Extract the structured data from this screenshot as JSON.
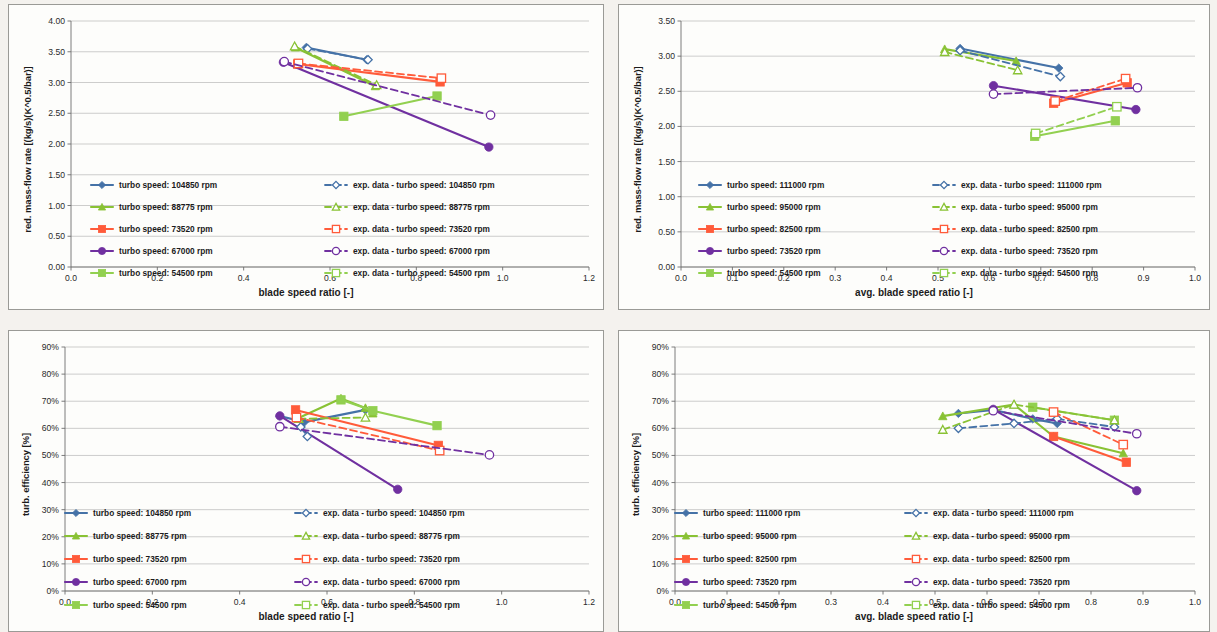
{
  "page": {
    "background": "#f4f2ee",
    "panel_background": "#fdfdfb",
    "panel_border": "#9a9a96"
  },
  "colors": {
    "blue": "#4572a7",
    "green": "#89c234",
    "orange": "#ff5b3a",
    "purple": "#7030a0",
    "lightgreen": "#92d050",
    "grid": "#b8b8b8",
    "axis": "#6d6d6d",
    "text": "#1b1b1b"
  },
  "charts": [
    {
      "id": "top-left",
      "name": "red-mass-flow-vs-blade-speed-ratio",
      "chart_data": {
        "type": "line",
        "title": "",
        "xlabel": "blade speed ratio [-]",
        "ylabel": "red. mass-flow rate [(kg/s)(K^0.5/bar)]",
        "xlim": [
          0.0,
          1.2
        ],
        "ylim": [
          0.0,
          4.0
        ],
        "xticks": [
          "0.0",
          "0.2",
          "0.4",
          "0.6",
          "0.8",
          "1.0",
          "1.2"
        ],
        "yticks": [
          "0.00",
          "0.50",
          "1.00",
          "1.50",
          "2.00",
          "2.50",
          "3.00",
          "3.50",
          "4.00"
        ],
        "grid": true,
        "legend_position": "inside-lower-center",
        "series": [
          {
            "name": "turbo speed: 104850 rpm",
            "color": "#4572a7",
            "style": "solid",
            "marker": "diamond",
            "filled": true,
            "x": [
              0.545,
              0.685
            ],
            "y": [
              3.57,
              3.37
            ]
          },
          {
            "name": "turbo speed: 88775 rpm",
            "color": "#89c234",
            "style": "solid",
            "marker": "triangle",
            "filled": true,
            "x": [
              0.52,
              0.705
            ],
            "y": [
              3.57,
              2.94
            ]
          },
          {
            "name": "turbo speed: 73520 rpm",
            "color": "#ff5b3a",
            "style": "solid",
            "marker": "square",
            "filled": true,
            "x": [
              0.525,
              0.855
            ],
            "y": [
              3.3,
              3.01
            ]
          },
          {
            "name": "turbo speed: 67000 rpm",
            "color": "#7030a0",
            "style": "solid",
            "marker": "circle",
            "filled": true,
            "x": [
              0.492,
              0.968
            ],
            "y": [
              3.33,
              1.95
            ]
          },
          {
            "name": "turbo speed: 54500 rpm",
            "color": "#92d050",
            "style": "solid",
            "marker": "square",
            "filled": true,
            "x": [
              0.632,
              0.848
            ],
            "y": [
              2.45,
              2.78
            ]
          },
          {
            "name": "exp. data - turbo speed: 104850 rpm",
            "color": "#4572a7",
            "style": "dashed",
            "marker": "diamond",
            "filled": false,
            "x": [
              0.548,
              0.688
            ],
            "y": [
              3.55,
              3.37
            ]
          },
          {
            "name": "exp. data - turbo speed: 88775 rpm",
            "color": "#89c234",
            "style": "dashed",
            "marker": "triangle",
            "filled": false,
            "x": [
              0.518,
              0.708
            ],
            "y": [
              3.59,
              2.96
            ]
          },
          {
            "name": "exp. data - turbo speed: 73520 rpm",
            "color": "#ff5b3a",
            "style": "dashed",
            "marker": "square",
            "filled": false,
            "x": [
              0.527,
              0.858
            ],
            "y": [
              3.31,
              3.07
            ]
          },
          {
            "name": "exp. data - turbo speed: 67000 rpm",
            "color": "#7030a0",
            "style": "dashed",
            "marker": "circle",
            "filled": false,
            "x": [
              0.494,
              0.972
            ],
            "y": [
              3.34,
              2.47
            ]
          },
          {
            "name": "exp. data - turbo speed: 54500 rpm",
            "color": "#92d050",
            "style": "dashed",
            "marker": "square",
            "filled": false,
            "x": [],
            "y": []
          }
        ],
        "legend_left": [
          "turbo speed: 104850 rpm",
          "turbo speed: 88775 rpm",
          "turbo speed: 73520 rpm",
          "turbo speed: 67000 rpm",
          "turbo speed: 54500 rpm"
        ],
        "legend_right": [
          "exp. data - turbo speed: 104850 rpm",
          "exp. data - turbo speed: 88775 rpm",
          "exp. data - turbo speed: 73520 rpm",
          "exp. data - turbo speed: 67000 rpm",
          "exp. data - turbo speed: 54500 rpm"
        ]
      }
    },
    {
      "id": "top-right",
      "name": "red-mass-flow-vs-avg-blade-speed-ratio",
      "chart_data": {
        "type": "line",
        "title": "",
        "xlabel": "avg. blade speed ratio [-]",
        "ylabel": "red. mass-flow rate [(kg/s)(K^0.5/bar)]",
        "xlim": [
          0.0,
          1.0
        ],
        "ylim": [
          0.0,
          3.5
        ],
        "xticks": [
          "0.0",
          "0.1",
          "0.2",
          "0.3",
          "0.4",
          "0.5",
          "0.6",
          "0.7",
          "0.8",
          "0.9",
          "1.0"
        ],
        "yticks": [
          "0.00",
          "0.50",
          "1.00",
          "1.50",
          "2.00",
          "2.50",
          "3.00",
          "3.50"
        ],
        "grid": true,
        "legend_position": "inside-lower-center",
        "series": [
          {
            "name": "turbo speed: 111000 rpm",
            "color": "#4572a7",
            "style": "solid",
            "marker": "diamond",
            "filled": true,
            "x": [
              0.543,
              0.735
            ],
            "y": [
              3.11,
              2.83
            ]
          },
          {
            "name": "turbo speed: 95000 rpm",
            "color": "#89c234",
            "style": "solid",
            "marker": "triangle",
            "filled": true,
            "x": [
              0.513,
              0.652
            ],
            "y": [
              3.1,
              2.93
            ]
          },
          {
            "name": "turbo speed: 82500 rpm",
            "color": "#ff5b3a",
            "style": "solid",
            "marker": "square",
            "filled": true,
            "x": [
              0.725,
              0.868
            ],
            "y": [
              2.33,
              2.62
            ]
          },
          {
            "name": "turbo speed: 73520 rpm",
            "color": "#7030a0",
            "style": "solid",
            "marker": "circle",
            "filled": true,
            "x": [
              0.608,
              0.885
            ],
            "y": [
              2.58,
              2.24
            ]
          },
          {
            "name": "turbo speed: 54500 rpm",
            "color": "#92d050",
            "style": "solid",
            "marker": "square",
            "filled": true,
            "x": [
              0.688,
              0.845
            ],
            "y": [
              1.86,
              2.08
            ]
          },
          {
            "name": "exp. data - turbo speed: 111000 rpm",
            "color": "#4572a7",
            "style": "dashed",
            "marker": "diamond",
            "filled": false,
            "x": [
              0.543,
              0.738
            ],
            "y": [
              3.08,
              2.71
            ]
          },
          {
            "name": "exp. data - turbo speed: 95000 rpm",
            "color": "#89c234",
            "style": "dashed",
            "marker": "triangle",
            "filled": false,
            "x": [
              0.513,
              0.655
            ],
            "y": [
              3.06,
              2.8
            ]
          },
          {
            "name": "exp. data - turbo speed: 82500 rpm",
            "color": "#ff5b3a",
            "style": "dashed",
            "marker": "square",
            "filled": false,
            "x": [
              0.728,
              0.865
            ],
            "y": [
              2.36,
              2.68
            ]
          },
          {
            "name": "exp. data - turbo speed: 73520 rpm",
            "color": "#7030a0",
            "style": "dashed",
            "marker": "circle",
            "filled": false,
            "x": [
              0.608,
              0.888
            ],
            "y": [
              2.46,
              2.55
            ]
          },
          {
            "name": "exp. data - turbo speed: 54500 rpm",
            "color": "#92d050",
            "style": "dashed",
            "marker": "square",
            "filled": false,
            "x": [
              0.69,
              0.848
            ],
            "y": [
              1.9,
              2.28
            ]
          }
        ],
        "legend_left": [
          "turbo speed: 111000 rpm",
          "turbo speed: 95000 rpm",
          "turbo speed: 82500 rpm",
          "turbo speed: 73520 rpm",
          "turbo speed: 54500 rpm"
        ],
        "legend_right": [
          "exp. data - turbo speed: 111000 rpm",
          "exp. data - turbo speed: 95000 rpm",
          "exp. data - turbo speed: 82500 rpm",
          "exp. data - turbo speed: 73520 rpm",
          "exp. data - turbo speed: 54500 rpm"
        ]
      }
    },
    {
      "id": "bottom-left",
      "name": "turb-efficiency-vs-blade-speed-ratio",
      "chart_data": {
        "type": "line",
        "title": "",
        "xlabel": "blade speed ratio [-]",
        "ylabel": "turb. efficiency [%]",
        "xlim": [
          0.0,
          1.2
        ],
        "ylim": [
          0,
          90
        ],
        "xticks": [
          "0.0",
          "0.2",
          "0.4",
          "0.6",
          "0.8",
          "1.0",
          "1.2"
        ],
        "yticks": [
          "0%",
          "10%",
          "20%",
          "30%",
          "40%",
          "50%",
          "60%",
          "70%",
          "80%",
          "90%"
        ],
        "grid": true,
        "legend_position": "inside-lower-center",
        "series": [
          {
            "name": "turbo speed: 104850 rpm",
            "color": "#4572a7",
            "style": "solid",
            "marker": "diamond",
            "filled": true,
            "x": [
              0.492,
              0.548,
              0.688
            ],
            "y": [
              64.5,
              62.3,
              66.8
            ]
          },
          {
            "name": "turbo speed: 88775 rpm",
            "color": "#89c234",
            "style": "solid",
            "marker": "triangle",
            "filled": true,
            "x": [
              0.535,
              0.632,
              0.688,
              0.705
            ],
            "y": [
              63.8,
              71.0,
              67.5,
              65.5
            ]
          },
          {
            "name": "turbo speed: 73520 rpm",
            "color": "#ff5b3a",
            "style": "solid",
            "marker": "square",
            "filled": true,
            "x": [
              0.528,
              0.855
            ],
            "y": [
              66.8,
              53.7
            ]
          },
          {
            "name": "turbo speed: 67000 rpm",
            "color": "#7030a0",
            "style": "solid",
            "marker": "circle",
            "filled": true,
            "x": [
              0.492,
              0.762
            ],
            "y": [
              64.6,
              37.5
            ]
          },
          {
            "name": "turbo speed: 54500 rpm",
            "color": "#92d050",
            "style": "solid",
            "marker": "square",
            "filled": true,
            "x": [
              0.632,
              0.705,
              0.852
            ],
            "y": [
              70.5,
              66.5,
              61.0
            ]
          },
          {
            "name": "exp. data - turbo speed: 104850 rpm",
            "color": "#4572a7",
            "style": "dashed",
            "marker": "diamond",
            "filled": false,
            "x": [
              0.54,
              0.555
            ],
            "y": [
              60.5,
              57.0
            ]
          },
          {
            "name": "exp. data - turbo speed: 88775 rpm",
            "color": "#89c234",
            "style": "dashed",
            "marker": "triangle",
            "filled": false,
            "x": [
              0.535,
              0.688
            ],
            "y": [
              63.5,
              64.0
            ]
          },
          {
            "name": "exp. data - turbo speed: 73520 rpm",
            "color": "#ff5b3a",
            "style": "dashed",
            "marker": "square",
            "filled": false,
            "x": [
              0.53,
              0.858
            ],
            "y": [
              64.0,
              51.8
            ]
          },
          {
            "name": "exp. data - turbo speed: 67000 rpm",
            "color": "#7030a0",
            "style": "dashed",
            "marker": "circle",
            "filled": false,
            "x": [
              0.492,
              0.972
            ],
            "y": [
              60.6,
              50.2
            ]
          },
          {
            "name": "exp. data - turbo speed: 54500 rpm",
            "color": "#92d050",
            "style": "dashed",
            "marker": "square",
            "filled": false,
            "x": [],
            "y": []
          }
        ],
        "legend_left": [
          "turbo speed: 104850 rpm",
          "turbo speed: 88775 rpm",
          "turbo speed: 73520 rpm",
          "turbo speed: 67000 rpm",
          "turbo speed: 54500 rpm"
        ],
        "legend_right": [
          "exp. data - turbo speed: 104850 rpm",
          "exp. data - turbo speed: 88775 rpm",
          "exp. data - turbo speed: 73520 rpm",
          "exp. data - turbo speed: 67000 rpm",
          "exp. data - turbo speed: 54500 rpm"
        ]
      }
    },
    {
      "id": "bottom-right",
      "name": "turb-efficiency-vs-avg-blade-speed-ratio",
      "chart_data": {
        "type": "line",
        "title": "",
        "xlabel": "avg. blade speed ratio [-]",
        "ylabel": "turb. efficiency [%]",
        "xlim": [
          0.0,
          1.0
        ],
        "ylim": [
          0,
          90
        ],
        "xticks": [
          "0.0",
          "0.1",
          "0.2",
          "0.3",
          "0.4",
          "0.5",
          "0.6",
          "0.7",
          "0.8",
          "0.9",
          "1.0"
        ],
        "yticks": [
          "0%",
          "10%",
          "20%",
          "30%",
          "40%",
          "50%",
          "60%",
          "70%",
          "80%",
          "90%"
        ],
        "grid": true,
        "legend_position": "inside-lower-center",
        "series": [
          {
            "name": "turbo speed: 111000 rpm",
            "color": "#4572a7",
            "style": "solid",
            "marker": "diamond",
            "filled": true,
            "x": [
              0.545,
              0.612,
              0.688,
              0.735
            ],
            "y": [
              65.5,
              66.8,
              63.5,
              61.8
            ]
          },
          {
            "name": "turbo speed: 95000 rpm",
            "color": "#89c234",
            "style": "solid",
            "marker": "triangle",
            "filled": true,
            "x": [
              0.515,
              0.652,
              0.728,
              0.862
            ],
            "y": [
              64.5,
              68.8,
              57.0,
              50.8
            ]
          },
          {
            "name": "turbo speed: 82500 rpm",
            "color": "#ff5b3a",
            "style": "solid",
            "marker": "square",
            "filled": true,
            "x": [
              0.728,
              0.868
            ],
            "y": [
              57.0,
              47.5
            ]
          },
          {
            "name": "turbo speed: 73520 rpm",
            "color": "#7030a0",
            "style": "solid",
            "marker": "circle",
            "filled": true,
            "x": [
              0.612,
              0.888
            ],
            "y": [
              67.0,
              37.0
            ]
          },
          {
            "name": "turbo speed: 54500 rpm",
            "color": "#92d050",
            "style": "solid",
            "marker": "square",
            "filled": true,
            "x": [
              0.688,
              0.845
            ],
            "y": [
              67.8,
              63.0
            ]
          },
          {
            "name": "exp. data - turbo speed: 111000 rpm",
            "color": "#4572a7",
            "style": "dashed",
            "marker": "diamond",
            "filled": false,
            "x": [
              0.545,
              0.652,
              0.735,
              0.845
            ],
            "y": [
              60.0,
              61.8,
              63.5,
              60.5
            ]
          },
          {
            "name": "exp. data - turbo speed: 95000 rpm",
            "color": "#89c234",
            "style": "dashed",
            "marker": "triangle",
            "filled": false,
            "x": [
              0.515,
              0.652,
              0.845
            ],
            "y": [
              59.5,
              68.8,
              63.0
            ]
          },
          {
            "name": "exp. data - turbo speed: 82500 rpm",
            "color": "#ff5b3a",
            "style": "dashed",
            "marker": "square",
            "filled": false,
            "x": [
              0.728,
              0.862
            ],
            "y": [
              66.0,
              54.0
            ]
          },
          {
            "name": "exp. data - turbo speed: 73520 rpm",
            "color": "#7030a0",
            "style": "dashed",
            "marker": "circle",
            "filled": false,
            "x": [
              0.612,
              0.888
            ],
            "y": [
              66.5,
              58.0
            ]
          },
          {
            "name": "exp. data - turbo speed: 54500 rpm",
            "color": "#92d050",
            "style": "dashed",
            "marker": "square",
            "filled": false,
            "x": [],
            "y": []
          }
        ],
        "legend_left": [
          "turbo speed: 111000 rpm",
          "turbo speed: 95000 rpm",
          "turbo speed: 82500 rpm",
          "turbo speed: 73520 rpm",
          "turbo speed: 54500 rpm"
        ],
        "legend_right": [
          "exp. data - turbo speed: 111000 rpm",
          "exp. data - turbo speed: 95000 rpm",
          "exp. data - turbo speed: 82500 rpm",
          "exp. data - turbo speed: 73520 rpm",
          "exp. data - turbo speed: 54500 rpm"
        ]
      }
    }
  ]
}
